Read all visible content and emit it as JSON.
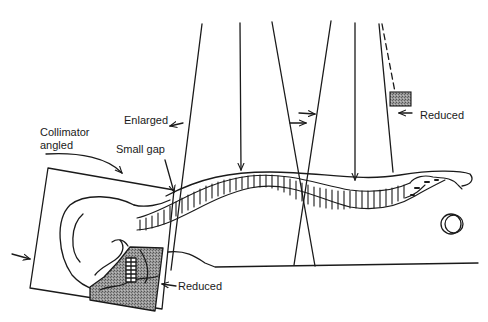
{
  "diagram": {
    "type": "radiography-collimation-schematic",
    "labels": {
      "enlarged": "Enlarged",
      "collimator_line1": "Collimator",
      "collimator_line2": "angled",
      "small_gap": "Small gap",
      "reduced_top": "Reduced",
      "reduced_bottom": "Reduced"
    },
    "elements": [
      {
        "name": "beam-1-divergent",
        "description": "Left divergent X-ray beam boundary"
      },
      {
        "name": "beam-2-central",
        "description": "Central ray arrow pointing to upper spine"
      },
      {
        "name": "beam-3-convergent",
        "description": "Crossing beam boundaries with overlap arrows"
      },
      {
        "name": "beam-4-central",
        "description": "Central ray arrow pointing to lower spine"
      },
      {
        "name": "beam-5-edge",
        "description": "Right beam edge with dashed reduced line and shield block"
      },
      {
        "name": "collimator-box",
        "description": "Angled collimator field around skull"
      },
      {
        "name": "shield-shaded",
        "description": "Hatched shielded region over jaw/neck"
      },
      {
        "name": "spine",
        "description": "Vertebral column from cervical to sacrum/coccyx"
      },
      {
        "name": "gonad-shield-circle",
        "description": "Double circle near pelvis"
      }
    ],
    "colors": {
      "line": "#1a1a1a",
      "shade": "#8a8a8a",
      "background": "#ffffff"
    }
  }
}
